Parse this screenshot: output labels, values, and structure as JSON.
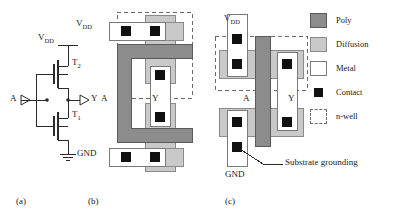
{
  "figure": {
    "type": "cmos-inverter-schematic-and-layouts",
    "captions": [
      {
        "id": "a",
        "text": "(a)",
        "x": 16,
        "y": 196
      },
      {
        "id": "b",
        "text": "(b)",
        "x": 88,
        "y": 196
      },
      {
        "id": "c",
        "text": "(c)",
        "x": 225,
        "y": 196
      }
    ]
  },
  "schematic": {
    "name": "cmos-inverter-schematic",
    "labels": {
      "vdd": "V",
      "vdd_sub": "DD",
      "input": "A",
      "output": "Y",
      "pmos": "T",
      "pmos_sub": "2",
      "nmos": "T",
      "nmos_sub": "1"
    },
    "nodes": [
      "V_DD",
      "A",
      "Y",
      "T_2",
      "T_1",
      "GND"
    ]
  },
  "layout_b": {
    "name": "layout-folded-poly",
    "labels": {
      "vdd": "V",
      "vdd_sub": "DD",
      "input": "A",
      "output": "Y",
      "gnd": "GND"
    },
    "contacts": 5,
    "nwell": true
  },
  "layout_c": {
    "name": "layout-straight-poly",
    "labels": {
      "vdd": "V",
      "vdd_sub": "DD",
      "input": "A",
      "output": "Y",
      "gnd": "GND",
      "annotation": "Substrate grounding"
    },
    "contacts": 5,
    "nwell": true
  },
  "legend": {
    "items": [
      {
        "swatch": "poly-swatch",
        "label": "Poly",
        "color": "#8c8c8c"
      },
      {
        "swatch": "diffusion-swatch",
        "label": "Diffusion",
        "color": "#c9c9c9"
      },
      {
        "swatch": "metal-swatch",
        "label": "Metal",
        "color": "#ffffff"
      },
      {
        "swatch": "contact-swatch",
        "label": "Contact",
        "color": "#111111"
      },
      {
        "swatch": "nwell-swatch",
        "label": "n-well",
        "color": "#6b6b6b"
      }
    ]
  },
  "colors": {
    "poly": "#8c8c8c",
    "poly_edge": "#5a5a5a",
    "diffusion": "#c9c9c9",
    "diffusion_edge": "#8a8a8a",
    "metal": "#ffffff",
    "metal_edge": "#7a7a7a",
    "contact": "#111111",
    "nwell": "#6b6b6b",
    "wire": "#2a2a2a"
  }
}
